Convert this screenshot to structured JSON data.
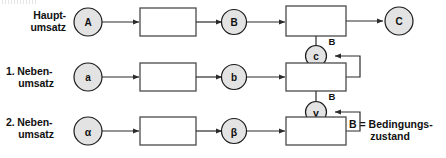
{
  "diagram": {
    "title_artifact": "",
    "rows": [
      {
        "id": "haupt",
        "label_line1": "Haupt-",
        "label_line2": "umsatz",
        "start_node": "A",
        "mid_node": "B",
        "end_node": "C",
        "condition_label": "B",
        "condition_node": "c"
      },
      {
        "id": "neben1",
        "label_line1": "1. Neben-",
        "label_line2": "umsatz",
        "start_node": "a",
        "mid_node": "b",
        "end_node": "",
        "condition_label": "B",
        "condition_node": "γ"
      },
      {
        "id": "neben2",
        "label_line1": "2. Neben-",
        "label_line2": "umsatz",
        "start_node": "α",
        "mid_node": "β",
        "end_node": "",
        "condition_label": "",
        "condition_node": ""
      }
    ],
    "legend": {
      "line1": "B = Bedingungs-",
      "line2": "zustand"
    },
    "colors": {
      "circle_fill": "#e3e3e3",
      "circle_stroke": "#1a1a1a",
      "box_fill": "#ffffff",
      "box_stroke": "#4a4a4a",
      "connector": "#2b2b2b",
      "text": "#111111",
      "background": "#ffffff"
    }
  }
}
